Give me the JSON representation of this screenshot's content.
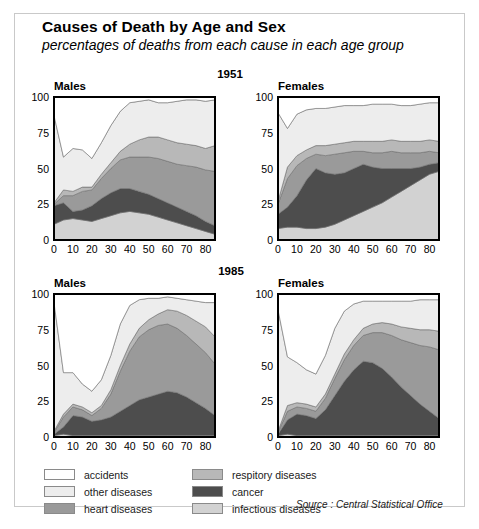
{
  "header": {
    "title": "Causes of Death by Age and Sex",
    "subtitle": "percentages of deaths from each cause in each age group"
  },
  "year_labels": {
    "top": "1951",
    "bottom": "1985"
  },
  "panel_titles": {
    "males": "Males",
    "females": "Females"
  },
  "source": "Source : Central Statistical Office",
  "legend": {
    "left_column": [
      {
        "label": "accidents",
        "color": "#ffffff"
      },
      {
        "label": "other diseases",
        "color": "#ededed"
      },
      {
        "label": "heart diseases",
        "color": "#9a9a9a"
      }
    ],
    "right_column": [
      {
        "label": "respitory diseases",
        "color": "#b8b8b8"
      },
      {
        "label": "cancer",
        "color": "#4d4d4d"
      },
      {
        "label": "infectious diseases",
        "color": "#d2d2d2"
      }
    ]
  },
  "colors": {
    "accidents": "#ffffff",
    "other_diseases": "#ededed",
    "respitory_diseases": "#b8b8b8",
    "heart_diseases": "#9a9a9a",
    "cancer": "#4d4d4d",
    "infectious_diseases": "#d2d2d2",
    "axis": "#000000",
    "grid": "#b5b5b5",
    "band_outline": "#6e6e6e",
    "frame": "#c9c9c9"
  },
  "chart_data": [
    {
      "type": "area",
      "id": "1951-males",
      "title": "Males",
      "year": "1951",
      "sex": "Males",
      "xlabel": "",
      "ylabel": "",
      "xlim": [
        0,
        85
      ],
      "ylim": [
        0,
        100
      ],
      "xticks": [
        0,
        10,
        20,
        30,
        40,
        50,
        60,
        70,
        80
      ],
      "yticks": [
        0,
        25,
        50,
        75,
        100
      ],
      "grid": true,
      "stacked": true,
      "stack_order_bottom_to_top": [
        "infectious diseases",
        "cancer",
        "heart diseases",
        "respitory diseases",
        "other diseases",
        "accidents"
      ],
      "x": [
        0,
        5,
        10,
        15,
        20,
        25,
        30,
        35,
        40,
        45,
        50,
        55,
        60,
        65,
        70,
        75,
        80,
        85
      ],
      "series": [
        {
          "name": "infectious diseases",
          "values": [
            11,
            14,
            15,
            14,
            13,
            15,
            17,
            19,
            20,
            19,
            18,
            16,
            14,
            12,
            10,
            8,
            6,
            4
          ]
        },
        {
          "name": "cancer",
          "values": [
            13,
            12,
            5,
            7,
            11,
            14,
            16,
            17,
            16,
            15,
            14,
            13,
            12,
            11,
            10,
            9,
            7,
            6
          ]
        },
        {
          "name": "heart diseases",
          "values": [
            1,
            5,
            11,
            13,
            11,
            14,
            17,
            20,
            22,
            24,
            26,
            28,
            29,
            30,
            32,
            34,
            36,
            38
          ]
        },
        {
          "name": "respitory diseases",
          "values": [
            1,
            4,
            3,
            3,
            2,
            3,
            4,
            6,
            9,
            12,
            14,
            15,
            15,
            15,
            15,
            15,
            15,
            18
          ]
        },
        {
          "name": "other diseases",
          "values": [
            61,
            23,
            30,
            26,
            20,
            22,
            26,
            28,
            29,
            27,
            26,
            24,
            26,
            29,
            31,
            32,
            33,
            32
          ]
        },
        {
          "name": "accidents",
          "values": [
            13,
            42,
            36,
            37,
            43,
            32,
            20,
            10,
            4,
            3,
            2,
            4,
            4,
            3,
            2,
            2,
            3,
            2
          ]
        }
      ]
    },
    {
      "type": "area",
      "id": "1951-females",
      "title": "Females",
      "year": "1951",
      "sex": "Females",
      "xlabel": "",
      "ylabel": "",
      "xlim": [
        0,
        85
      ],
      "ylim": [
        0,
        100
      ],
      "xticks": [
        0,
        10,
        20,
        30,
        40,
        50,
        60,
        70,
        80
      ],
      "yticks": [
        0,
        25,
        50,
        75,
        100
      ],
      "grid": true,
      "stacked": true,
      "stack_order_bottom_to_top": [
        "infectious diseases",
        "cancer",
        "heart diseases",
        "respitory diseases",
        "other diseases",
        "accidents"
      ],
      "x": [
        0,
        5,
        10,
        15,
        20,
        25,
        30,
        35,
        40,
        45,
        50,
        55,
        60,
        65,
        70,
        75,
        80,
        85
      ],
      "series": [
        {
          "name": "infectious diseases",
          "values": [
            8,
            9,
            9,
            8,
            8,
            9,
            11,
            14,
            17,
            20,
            23,
            26,
            30,
            34,
            38,
            42,
            46,
            48
          ]
        },
        {
          "name": "cancer",
          "values": [
            10,
            14,
            22,
            34,
            42,
            38,
            35,
            33,
            33,
            33,
            28,
            24,
            20,
            16,
            12,
            9,
            7,
            6
          ]
        },
        {
          "name": "heart diseases",
          "values": [
            7,
            20,
            21,
            15,
            10,
            12,
            14,
            14,
            12,
            9,
            10,
            11,
            12,
            11,
            11,
            10,
            9,
            7
          ]
        },
        {
          "name": "respitory diseases",
          "values": [
            2,
            8,
            7,
            6,
            6,
            7,
            7,
            7,
            7,
            7,
            8,
            8,
            8,
            8,
            8,
            8,
            8,
            8
          ]
        },
        {
          "name": "other diseases",
          "values": [
            62,
            27,
            29,
            28,
            26,
            26,
            26,
            26,
            25,
            25,
            26,
            26,
            25,
            25,
            25,
            26,
            26,
            27
          ]
        },
        {
          "name": "accidents",
          "values": [
            11,
            22,
            12,
            9,
            8,
            8,
            7,
            6,
            6,
            6,
            5,
            5,
            5,
            6,
            6,
            5,
            4,
            4
          ]
        }
      ]
    },
    {
      "type": "area",
      "id": "1985-males",
      "title": "Males",
      "year": "1985",
      "sex": "Males",
      "xlabel": "",
      "ylabel": "",
      "xlim": [
        0,
        85
      ],
      "ylim": [
        0,
        100
      ],
      "xticks": [
        0,
        10,
        20,
        30,
        40,
        50,
        60,
        70,
        80
      ],
      "yticks": [
        0,
        25,
        50,
        75,
        100
      ],
      "grid": true,
      "stacked": true,
      "stack_order_bottom_to_top": [
        "infectious diseases",
        "cancer",
        "heart diseases",
        "respitory diseases",
        "other diseases",
        "accidents"
      ],
      "x": [
        0,
        5,
        10,
        15,
        20,
        25,
        30,
        35,
        40,
        45,
        50,
        55,
        60,
        65,
        70,
        75,
        80,
        85
      ],
      "series": [
        {
          "name": "infectious diseases",
          "values": [
            1,
            2,
            1,
            1,
            1,
            1,
            1,
            1,
            1,
            1,
            1,
            1,
            1,
            1,
            1,
            1,
            1,
            1
          ]
        },
        {
          "name": "cancer",
          "values": [
            1,
            5,
            14,
            13,
            10,
            11,
            13,
            17,
            21,
            25,
            27,
            29,
            31,
            30,
            27,
            23,
            19,
            14
          ]
        },
        {
          "name": "heart diseases",
          "values": [
            1,
            7,
            6,
            5,
            4,
            8,
            16,
            28,
            38,
            44,
            47,
            48,
            47,
            45,
            43,
            41,
            39,
            36
          ]
        },
        {
          "name": "respitory diseases",
          "values": [
            1,
            2,
            2,
            2,
            2,
            2,
            3,
            4,
            5,
            6,
            7,
            8,
            10,
            12,
            14,
            16,
            18,
            19
          ]
        },
        {
          "name": "other diseases",
          "values": [
            90,
            29,
            22,
            16,
            15,
            18,
            24,
            29,
            27,
            20,
            15,
            11,
            9,
            9,
            11,
            14,
            17,
            24
          ]
        },
        {
          "name": "accidents",
          "values": [
            6,
            55,
            55,
            63,
            68,
            60,
            43,
            21,
            8,
            4,
            3,
            3,
            2,
            3,
            4,
            5,
            6,
            6
          ]
        }
      ]
    },
    {
      "type": "area",
      "id": "1985-females",
      "title": "Females",
      "year": "1985",
      "sex": "Females",
      "xlabel": "",
      "ylabel": "",
      "xlim": [
        0,
        85
      ],
      "ylim": [
        0,
        100
      ],
      "xticks": [
        0,
        10,
        20,
        30,
        40,
        50,
        60,
        70,
        80
      ],
      "yticks": [
        0,
        25,
        50,
        75,
        100
      ],
      "grid": true,
      "stacked": true,
      "stack_order_bottom_to_top": [
        "infectious diseases",
        "cancer",
        "heart diseases",
        "respitory diseases",
        "other diseases",
        "accidents"
      ],
      "x": [
        0,
        5,
        10,
        15,
        20,
        25,
        30,
        35,
        40,
        45,
        50,
        55,
        60,
        65,
        70,
        75,
        80,
        85
      ],
      "series": [
        {
          "name": "infectious diseases",
          "values": [
            1,
            2,
            1,
            1,
            1,
            1,
            1,
            1,
            1,
            1,
            1,
            1,
            1,
            1,
            1,
            1,
            1,
            1
          ]
        },
        {
          "name": "cancer",
          "values": [
            1,
            10,
            15,
            14,
            12,
            18,
            28,
            38,
            46,
            52,
            51,
            47,
            41,
            34,
            28,
            22,
            17,
            12
          ]
        },
        {
          "name": "heart diseases",
          "values": [
            1,
            6,
            5,
            5,
            5,
            8,
            12,
            15,
            17,
            18,
            21,
            25,
            29,
            33,
            37,
            41,
            45,
            48
          ]
        },
        {
          "name": "respitory diseases",
          "values": [
            1,
            4,
            3,
            3,
            3,
            3,
            3,
            4,
            4,
            5,
            6,
            7,
            8,
            9,
            10,
            11,
            12,
            13
          ]
        },
        {
          "name": "other diseases",
          "values": [
            85,
            34,
            28,
            24,
            23,
            27,
            32,
            30,
            25,
            19,
            16,
            15,
            16,
            18,
            19,
            21,
            21,
            22
          ]
        },
        {
          "name": "accidents",
          "values": [
            11,
            44,
            48,
            53,
            56,
            43,
            24,
            12,
            7,
            5,
            5,
            5,
            5,
            5,
            5,
            4,
            4,
            4
          ]
        }
      ]
    }
  ]
}
